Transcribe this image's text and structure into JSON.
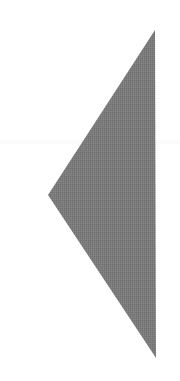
{
  "glyph": {
    "icon": "triangle-left-icon",
    "label": "Previous",
    "fill_color": "#7a7a7a",
    "background_color": "#ffffff",
    "vertices": {
      "top": [
        155,
        30
      ],
      "left": [
        48,
        195
      ],
      "bottom": [
        156,
        358
      ]
    }
  }
}
